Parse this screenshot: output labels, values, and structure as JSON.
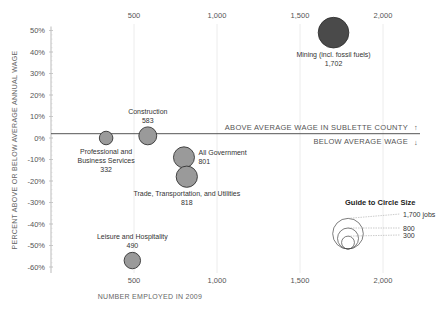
{
  "chart_data": {
    "type": "scatter",
    "subtype": "bubble",
    "title": "",
    "xlabel": "NUMBER EMPLOYED IN 2009",
    "ylabel": "PERCENT ABOVE OR BELOW AVERAGE ANNUAL WAGE",
    "xlim": [
      0,
      2200
    ],
    "ylim": [
      -60,
      50
    ],
    "x_ticks": [
      500,
      1000,
      1500,
      2000
    ],
    "x_tick_labels": [
      "500",
      "1,000",
      "1,500",
      "2,000"
    ],
    "y_ticks": [
      50,
      40,
      30,
      20,
      10,
      0,
      -10,
      -20,
      -30,
      -40,
      -50,
      -60
    ],
    "y_tick_labels": [
      "50%",
      "40%",
      "30%",
      "20%",
      "10%",
      "0%",
      "-10%",
      "-20%",
      "-30%",
      "-40%",
      "-50%",
      "-60%"
    ],
    "grid": "vertical",
    "reference_line": {
      "y": 2,
      "label_above": "ABOVE AVERAGE WAGE IN SUBLETTE COUNTY",
      "label_below": "BELOW AVERAGE WAGE",
      "arrow_up": "↑",
      "arrow_down": "↓"
    },
    "points": [
      {
        "name": "Mining (incl. fossil fuels)",
        "label_lines": [
          "Mining (incl. fossil fuels)",
          "1,702"
        ],
        "x": 1702,
        "y": 49,
        "size": 1702,
        "color": "#4a4a4a",
        "label_pos": "below"
      },
      {
        "name": "Construction",
        "label_lines": [
          "Construction",
          "583"
        ],
        "x": 583,
        "y": 1,
        "size": 583,
        "color": "#9a9a9a",
        "label_pos": "above"
      },
      {
        "name": "Professional and Business Services",
        "label_lines": [
          "Professional and",
          "Business Services",
          "332"
        ],
        "x": 332,
        "y": 0,
        "size": 332,
        "color": "#9a9a9a",
        "label_pos": "below"
      },
      {
        "name": "All Government",
        "label_lines": [
          "All Government",
          "801"
        ],
        "x": 801,
        "y": -9,
        "size": 801,
        "color": "#9a9a9a",
        "label_pos": "right"
      },
      {
        "name": "Trade, Transportation, and Utilities",
        "label_lines": [
          "Trade, Transportation, and Utilities",
          "818"
        ],
        "x": 818,
        "y": -18,
        "size": 818,
        "color": "#9a9a9a",
        "label_pos": "below"
      },
      {
        "name": "Leisure and Hospitality",
        "label_lines": [
          "Leisure and Hospitality",
          "490"
        ],
        "x": 490,
        "y": -57,
        "size": 490,
        "color": "#9a9a9a",
        "label_pos": "above"
      }
    ],
    "size_guide": {
      "title": "Guide to Circle Size",
      "entries": [
        {
          "value": 1700,
          "label": "1,700 jobs"
        },
        {
          "value": 800,
          "label": "800"
        },
        {
          "value": 300,
          "label": "300"
        }
      ]
    }
  }
}
